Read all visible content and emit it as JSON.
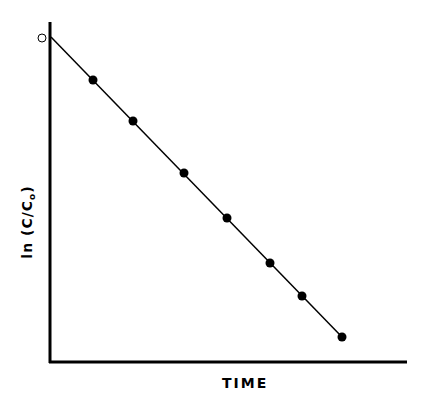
{
  "chart_data": {
    "type": "line",
    "title": "",
    "xlabel": "TIME",
    "ylabel_main": "ln (C/C",
    "ylabel_sub": "o",
    "ylabel_close": ")",
    "ylabel": "ln (C/Co)",
    "grid": false,
    "legend": null,
    "ticks": false,
    "annotations": [
      "open circle at origin (t=0, ln(C/Co)=0)"
    ],
    "initial_point": {
      "x": 0,
      "y": 0,
      "marker": "open-circle"
    },
    "series": [
      {
        "name": "ln (C/Co) vs TIME",
        "marker": "filled-circle",
        "x": [
          1,
          2,
          3.2,
          4.25,
          5.3,
          6.05,
          7.0
        ],
        "y": [
          -1.45,
          -2.85,
          -4.6,
          -6.15,
          -7.7,
          -8.8,
          -10.2
        ]
      }
    ],
    "fit_line": {
      "x": [
        0,
        7.0
      ],
      "y": [
        0,
        -10.2
      ]
    },
    "axis_pixels": {
      "origin": [
        50,
        362
      ],
      "y_top": 22,
      "x_right": 407
    },
    "point_pixels": {
      "open": [
        42,
        38
      ],
      "line_start": [
        51,
        37
      ],
      "line_end": [
        342,
        337
      ],
      "filled": [
        [
          93,
          80
        ],
        [
          133,
          121
        ],
        [
          184,
          173
        ],
        [
          227,
          218
        ],
        [
          270,
          263
        ],
        [
          302,
          296
        ],
        [
          342,
          337
        ]
      ]
    }
  },
  "colors": {
    "ink": "#000000",
    "background": "#ffffff"
  }
}
